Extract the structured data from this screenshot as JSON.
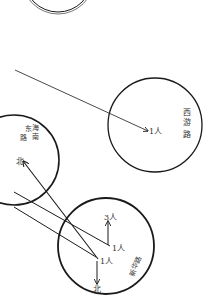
{
  "diagram": {
    "background": "#ffffff",
    "stroke_color": "#1a1a1a",
    "text_color": "#333333",
    "circles": [
      {
        "id": "top-circle",
        "cx": 58,
        "cy": -22,
        "r": 34,
        "double": true
      },
      {
        "id": "right-circle",
        "cx": 155,
        "cy": 125,
        "r": 47
      },
      {
        "id": "left-circle",
        "cx": 14,
        "cy": 160,
        "r": 45
      },
      {
        "id": "bottom-circle",
        "cx": 106,
        "cy": 246,
        "r": 48
      }
    ],
    "labels": {
      "right_circle_name": [
        "西",
        "游",
        "路"
      ],
      "left_circle_name_col1": [
        "东",
        "路"
      ],
      "left_circle_name_col2": [
        "海",
        "南"
      ],
      "left_circle_dir": "北",
      "right_arrow_label": "1人",
      "bottom_top_label": "3人",
      "bottom_mid_label": "1人",
      "bottom_center_label": "1人",
      "bottom_bottom_label": "北",
      "bottom_side_name": "新华路"
    }
  }
}
